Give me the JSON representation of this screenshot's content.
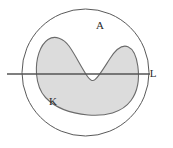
{
  "figure": {
    "name": "set-diagram-kernel-in-disc-with-line",
    "background_color": "#ffffff",
    "labels": [
      {
        "id": "outer-region",
        "text": "A",
        "x": 100,
        "y": 29
      },
      {
        "id": "shaded-region",
        "text": "K",
        "x": 53,
        "y": 105
      },
      {
        "id": "horizontal-line",
        "text": "L",
        "x": 153,
        "y": 77
      }
    ],
    "shapes": {
      "outer_circle": {
        "name": "outer-circle-boundary-A",
        "cx": 85.5,
        "cy": 72.5,
        "r": 63.5,
        "stroke": "#595959",
        "stroke_width": 1,
        "fill": "none"
      },
      "line": {
        "name": "horizontal-secant-line-L",
        "x1": 7,
        "y1": 74,
        "x2": 150,
        "y2": 74,
        "stroke": "#555555",
        "stroke_width": 1.6
      },
      "blob": {
        "name": "shaded-kidney-region-K",
        "fill": "#dcdcdc",
        "stroke": "#6b6b6b",
        "stroke_width": 1.1,
        "path": "M 36.5 74 C 35.5 59 40 45 48 39.5 C 55 34.8 63.5 38.5 69 46 C 75.5 55 81 67 87.5 76.5 C 90 80.2 92.5 81.5 95 79.6 C 99 76.5 104.5 67 110 58.5 C 116 49.2 122.5 44.5 128 46.8 C 133.5 49.2 136.5 57 137.8 66 C 139.5 78 138 91 131 100.5 C 122 112.8 105 116.5 88 115 C 70 113.4 55 107.5 45.5 97.5 C 39.5 91 37.2 82.5 36.5 74 Z"
      }
    }
  }
}
